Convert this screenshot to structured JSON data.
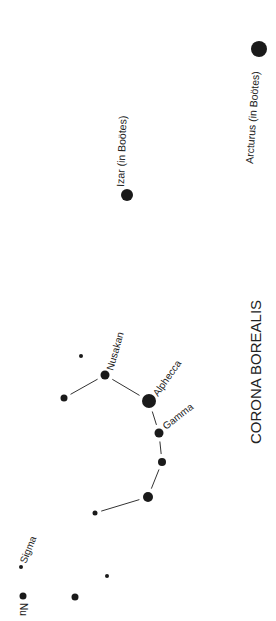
{
  "title": "CORONA BOREALIS",
  "colors": {
    "star": "#1a1a1a",
    "line": "#333333",
    "text": "#222222",
    "background": "#ffffff"
  },
  "stars": [
    {
      "id": "arcturus",
      "label": "Arcturus (in Boötes)",
      "x": 259,
      "y": 49,
      "r": 8
    },
    {
      "id": "izar",
      "label": "Izar (in Boötes)",
      "x": 127,
      "y": 195,
      "r": 6
    },
    {
      "id": "s1",
      "label": "",
      "x": 81,
      "y": 356,
      "r": 2
    },
    {
      "id": "nusakan",
      "label": "Nusakan",
      "x": 105,
      "y": 375,
      "r": 4.5
    },
    {
      "id": "s2",
      "label": "",
      "x": 64,
      "y": 398,
      "r": 3.5
    },
    {
      "id": "alphecca",
      "label": "Alphecca",
      "x": 149,
      "y": 401,
      "r": 7
    },
    {
      "id": "gamma",
      "label": "Gamma",
      "x": 159,
      "y": 433,
      "r": 4.5
    },
    {
      "id": "s3",
      "label": "",
      "x": 162,
      "y": 462,
      "r": 4
    },
    {
      "id": "s4",
      "label": "",
      "x": 148,
      "y": 497,
      "r": 5
    },
    {
      "id": "s5",
      "label": "",
      "x": 95,
      "y": 513,
      "r": 2.5
    },
    {
      "id": "sigma",
      "label": "Sigma",
      "x": 21,
      "y": 567,
      "r": 2
    },
    {
      "id": "s6",
      "label": "",
      "x": 107,
      "y": 576,
      "r": 2
    },
    {
      "id": "nu",
      "label": "Nu",
      "x": 23,
      "y": 596,
      "r": 3.5
    },
    {
      "id": "s7",
      "label": "",
      "x": 75,
      "y": 597,
      "r": 3.5
    }
  ],
  "lines": [
    [
      "s2",
      "nusakan"
    ],
    [
      "nusakan",
      "alphecca"
    ],
    [
      "alphecca",
      "gamma"
    ],
    [
      "gamma",
      "s3"
    ],
    [
      "s3",
      "s4"
    ],
    [
      "s4",
      "s5"
    ]
  ],
  "labels": {
    "arcturus": "Arcturus (in Boötes)",
    "izar": "Izar (in Boötes)",
    "nusakan": "Nusakan",
    "alphecca": "Alphecca",
    "gamma": "Gamma",
    "sigma": "Sigma",
    "nu": "Nu"
  }
}
